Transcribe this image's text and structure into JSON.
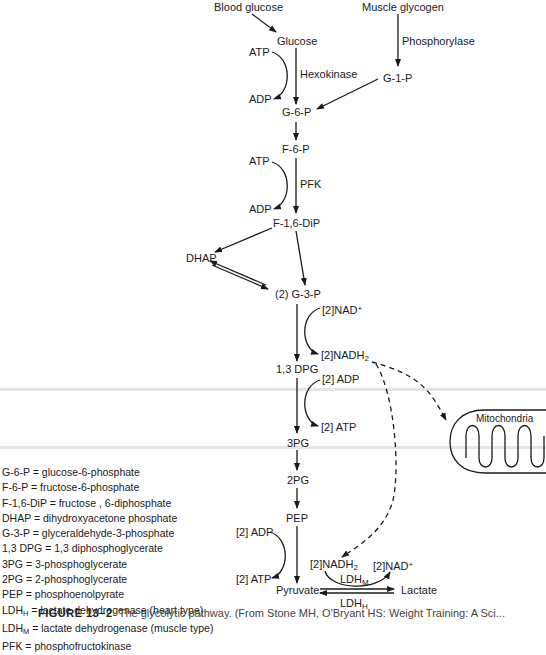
{
  "nodes": {
    "blood_glucose": "Blood glucose",
    "muscle_glycogen": "Muscle glycogen",
    "glucose": "Glucose",
    "g1p": "G-1-P",
    "g6p": "G-6-P",
    "f6p": "F-6-P",
    "f16dip": "F-1,6-DiP",
    "dhap": "DHAP",
    "g3p": "(2) G-3-P",
    "dpg13": "1,3 DPG",
    "pg3": "3PG",
    "pg2": "2PG",
    "pep": "PEP",
    "pyruvate": "Pyruvate",
    "lactate": "Lactate",
    "mitochondria": "Mitochondria"
  },
  "enzymes": {
    "hexokinase": "Hexokinase",
    "phosphorylase": "Phosphorylase",
    "pfk": "PFK",
    "ldh_m_base": "LDH",
    "ldh_m_sub": "M",
    "ldh_h_base": "LDH",
    "ldh_h_sub": "H"
  },
  "cofactors": {
    "hexokinase_atp": "ATP",
    "hexokinase_adp": "ADP",
    "pfk_atp": "ATP",
    "pfk_adp": "ADP",
    "g3p_nad_base": "[2]NAD",
    "g3p_nad_sup": "+",
    "g3p_nadh_base": "[2]NADH",
    "g3p_nadh_sub": "2",
    "dpg_adp": "[2] ADP",
    "dpg_atp": "[2] ATP",
    "pep_adp": "[2] ADP",
    "pep_atp": "[2] ATP",
    "ldh_nadh_base": "[2]NADH",
    "ldh_nadh_sub": "2",
    "ldh_nad_base": "[2]NAD",
    "ldh_nad_sup": "+"
  },
  "legend": [
    {
      "abbr": "G-6-P",
      "sub": "",
      "def": "glucose-6-phosphate"
    },
    {
      "abbr": "F-6-P",
      "sub": "",
      "def": "fructose-6-phosphate"
    },
    {
      "abbr": "F-1,6-DiP",
      "sub": "",
      "def": "fructose , 6-diphosphate"
    },
    {
      "abbr": "DHAP",
      "sub": "",
      "def": "dihydroxyacetone phosphate"
    },
    {
      "abbr": "G-3-P",
      "sub": "",
      "def": "glyceraldehyde-3-phosphate"
    },
    {
      "abbr": "1,3 DPG",
      "sub": "",
      "def": "1,3 diphosphoglycerate"
    },
    {
      "abbr": "3PG",
      "sub": "",
      "def": "3-phosphoglycerate"
    },
    {
      "abbr": "2PG",
      "sub": "",
      "def": "2-phosphoglycerate"
    },
    {
      "abbr": "PEP",
      "sub": "",
      "def": "phosphoenolpyrate"
    },
    {
      "abbr": "LDH",
      "sub": "H",
      "def": "lactate dehydrogenase (heart type)"
    },
    {
      "abbr": "LDH",
      "sub": "M",
      "def": "lactate dehydrogenase (muscle type)"
    },
    {
      "abbr": "PFK",
      "sub": "",
      "def": "phosphofructokinase"
    }
  ],
  "caption": {
    "label": "FIGURE 13–2",
    "text": "The glycolytic pathway. (From Stone MH, O'Bryant HS: Weight Training: A Sci..."
  },
  "colors": {
    "ink": "#1a1a1a",
    "background": "#ffffff",
    "scan_band": "#e4e4e4"
  }
}
